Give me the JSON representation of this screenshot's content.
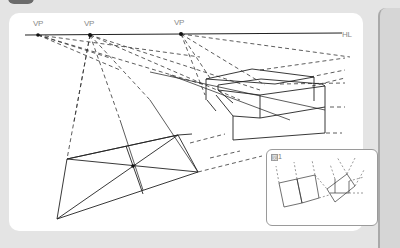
{
  "diagram": {
    "vanishing_points": [
      {
        "label": "VP",
        "x": 38,
        "y": 35
      },
      {
        "label": "VP",
        "x": 90,
        "y": 35
      },
      {
        "label": "VP",
        "x": 181,
        "y": 34
      }
    ],
    "horizon_line": {
      "label": "HL"
    },
    "inset": {
      "figure_glyph": "図",
      "figure_number": "1"
    },
    "colors": {
      "background": "#e4e4e4",
      "panel": "#ffffff",
      "ink": "#222222",
      "label": "#8a8a8a"
    }
  }
}
